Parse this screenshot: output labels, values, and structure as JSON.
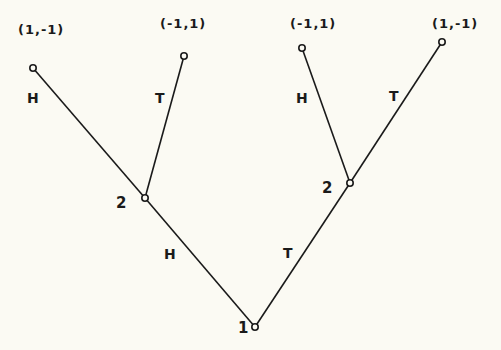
{
  "diagram": {
    "type": "extensive-form game tree",
    "background_color": "#fbfaf3",
    "line_color": "#1a1a1a",
    "nodes": {
      "root": {
        "player_label": "1",
        "x": 255,
        "y": 327
      },
      "left_decision": {
        "player_label": "2",
        "x": 145,
        "y": 198
      },
      "right_decision": {
        "player_label": "2",
        "x": 350,
        "y": 183
      },
      "leaf_hh": {
        "payoff": "(1,-1)",
        "x": 33,
        "y": 68
      },
      "leaf_ht": {
        "payoff": "(-1,1)",
        "x": 184,
        "y": 56
      },
      "leaf_th": {
        "payoff": "(-1,1)",
        "x": 302,
        "y": 48
      },
      "leaf_tt": {
        "payoff": "(1,-1)",
        "x": 442,
        "y": 42
      }
    },
    "edges": {
      "root_left": {
        "label": "H"
      },
      "root_right": {
        "label": "T"
      },
      "left_to_hh": {
        "label": "H"
      },
      "left_to_ht": {
        "label": "T"
      },
      "right_to_th": {
        "label": "H"
      },
      "right_to_tt": {
        "label": "T"
      }
    }
  }
}
